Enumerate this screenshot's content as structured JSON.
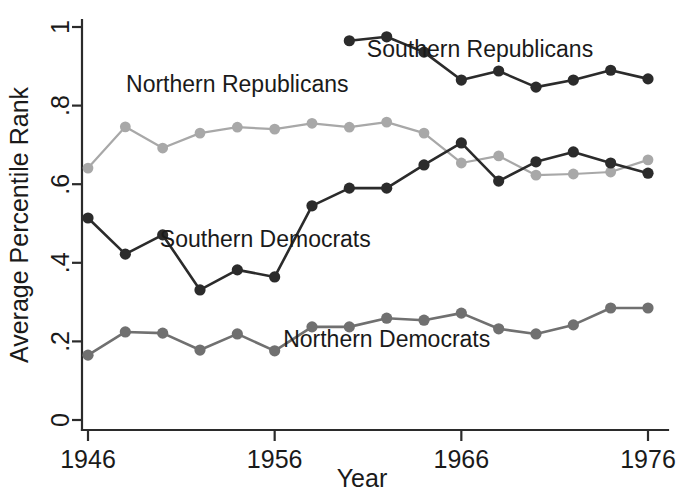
{
  "chart_data": {
    "type": "line",
    "title": "",
    "xlabel": "Year",
    "ylabel": "Average Percentile Rank",
    "xlim": [
      1945,
      1977
    ],
    "ylim": [
      0,
      1
    ],
    "xticks": [
      1946,
      1956,
      1966,
      1976
    ],
    "xticklabels": [
      "1946",
      "1956",
      "1966",
      "1976"
    ],
    "yticks": [
      0,
      0.2,
      0.4,
      0.6,
      0.8,
      1
    ],
    "yticklabels": [
      "0",
      ".2",
      ".4",
      ".6",
      ".8",
      "1"
    ],
    "grid": false,
    "legend_position": "inline-annotations",
    "series": [
      {
        "name": "Southern Republicans",
        "color": "#2b2b2b",
        "marker": "circle",
        "label_x": 1967.0,
        "label_y": 0.925,
        "x": [
          1960,
          1962,
          1964,
          1966,
          1968,
          1970,
          1972,
          1974,
          1976
        ],
        "y": [
          0.965,
          0.975,
          0.936,
          0.865,
          0.888,
          0.847,
          0.865,
          0.89,
          0.868
        ]
      },
      {
        "name": "Northern Republicans",
        "color": "#a8a8a8",
        "marker": "circle",
        "label_x": 1954.0,
        "label_y": 0.835,
        "x": [
          1946,
          1948,
          1950,
          1952,
          1954,
          1956,
          1958,
          1960,
          1962,
          1964,
          1966,
          1968,
          1970,
          1972,
          1974,
          1976
        ],
        "y": [
          0.641,
          0.746,
          0.692,
          0.73,
          0.745,
          0.74,
          0.755,
          0.745,
          0.758,
          0.73,
          0.654,
          0.672,
          0.623,
          0.626,
          0.631,
          0.662
        ]
      },
      {
        "name": "Southern Democrats",
        "color": "#2b2b2b",
        "marker": "circle",
        "label_x": 1955.5,
        "label_y": 0.44,
        "x": [
          1946,
          1948,
          1950,
          1952,
          1954,
          1956,
          1958,
          1960,
          1962,
          1964,
          1966,
          1968,
          1970,
          1972,
          1974,
          1976
        ],
        "y": [
          0.514,
          0.422,
          0.471,
          0.331,
          0.382,
          0.364,
          0.545,
          0.59,
          0.59,
          0.649,
          0.705,
          0.608,
          0.657,
          0.682,
          0.654,
          0.628
        ]
      },
      {
        "name": "Northern Democrats",
        "color": "#707070",
        "marker": "circle",
        "label_x": 1962.0,
        "label_y": 0.185,
        "x": [
          1946,
          1948,
          1950,
          1952,
          1954,
          1956,
          1958,
          1960,
          1962,
          1964,
          1966,
          1968,
          1970,
          1972,
          1974,
          1976
        ],
        "y": [
          0.165,
          0.224,
          0.221,
          0.178,
          0.219,
          0.176,
          0.237,
          0.237,
          0.259,
          0.254,
          0.272,
          0.232,
          0.219,
          0.242,
          0.285,
          0.285
        ]
      }
    ]
  },
  "axes": {
    "y_title": "Average Percentile Rank",
    "x_title": "Year"
  },
  "colors": {
    "axis": "#2b2b2b",
    "text": "#1a1a1a",
    "background": "#ffffff",
    "southern_republicans": "#2b2b2b",
    "northern_republicans": "#a8a8a8",
    "southern_democrats": "#2b2b2b",
    "northern_democrats": "#707070"
  }
}
